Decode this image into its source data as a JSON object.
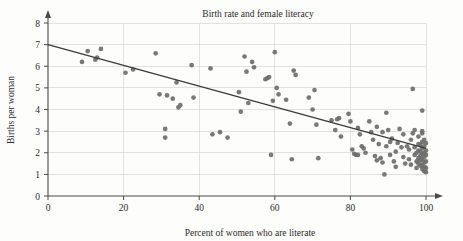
{
  "chart_data": {
    "type": "scatter",
    "title": "Birth rate and female literacy",
    "xlabel": "Percent of women who are literate",
    "ylabel": "Births per woman",
    "xlim": [
      0,
      100
    ],
    "ylim": [
      0,
      8
    ],
    "xticks": [
      0,
      20,
      40,
      60,
      80,
      100
    ],
    "yticks": [
      0,
      1,
      2,
      3,
      4,
      5,
      6,
      7,
      8
    ],
    "grid": true,
    "legend": "none",
    "marker_color": "#6e6e6e",
    "trendline": {
      "label": "least-squares regression line",
      "color": "#3a3a3a",
      "x_start": 0,
      "y_start": 7.0,
      "x_end": 100,
      "y_end": 2.2,
      "slope": -0.048,
      "intercept": 7.0
    },
    "points": [
      [
        9.0,
        6.2
      ],
      [
        10.5,
        6.7
      ],
      [
        12.5,
        6.3
      ],
      [
        13.0,
        6.4
      ],
      [
        14.0,
        6.8
      ],
      [
        20.5,
        5.7
      ],
      [
        22.5,
        5.85
      ],
      [
        28.5,
        6.6
      ],
      [
        29.5,
        4.7
      ],
      [
        31.0,
        3.1
      ],
      [
        31.0,
        2.7
      ],
      [
        31.5,
        4.65
      ],
      [
        33.0,
        4.5
      ],
      [
        34.0,
        5.25
      ],
      [
        34.5,
        4.1
      ],
      [
        35.0,
        4.2
      ],
      [
        38.0,
        6.05
      ],
      [
        38.5,
        4.55
      ],
      [
        43.0,
        5.9
      ],
      [
        43.5,
        2.85
      ],
      [
        45.5,
        2.95
      ],
      [
        47.5,
        2.7
      ],
      [
        50.5,
        4.8
      ],
      [
        51.0,
        3.9
      ],
      [
        52.0,
        6.45
      ],
      [
        52.5,
        5.75
      ],
      [
        53.0,
        4.3
      ],
      [
        54.0,
        6.2
      ],
      [
        54.5,
        5.95
      ],
      [
        57.5,
        5.4
      ],
      [
        58.0,
        5.45
      ],
      [
        58.5,
        5.5
      ],
      [
        59.0,
        1.9
      ],
      [
        59.5,
        4.4
      ],
      [
        60.0,
        6.65
      ],
      [
        60.5,
        5.0
      ],
      [
        61.0,
        4.7
      ],
      [
        63.0,
        4.45
      ],
      [
        64.0,
        3.35
      ],
      [
        64.5,
        1.7
      ],
      [
        65.0,
        5.8
      ],
      [
        65.5,
        5.6
      ],
      [
        69.0,
        4.55
      ],
      [
        70.0,
        4.0
      ],
      [
        70.5,
        4.9
      ],
      [
        71.0,
        3.3
      ],
      [
        71.5,
        1.75
      ],
      [
        75.0,
        3.5
      ],
      [
        76.0,
        3.05
      ],
      [
        76.5,
        3.55
      ],
      [
        77.0,
        3.6
      ],
      [
        77.5,
        2.75
      ],
      [
        79.5,
        3.8
      ],
      [
        80.0,
        3.45
      ],
      [
        80.5,
        2.15
      ],
      [
        81.0,
        1.95
      ],
      [
        81.5,
        1.9
      ],
      [
        82.0,
        3.15
      ],
      [
        82.5,
        2.85
      ],
      [
        83.0,
        2.3
      ],
      [
        83.5,
        2.2
      ],
      [
        85.0,
        3.45
      ],
      [
        85.5,
        2.95
      ],
      [
        86.0,
        2.6
      ],
      [
        86.5,
        1.85
      ],
      [
        87.0,
        3.2
      ],
      [
        87.5,
        2.4
      ],
      [
        88.0,
        1.75
      ],
      [
        88.5,
        1.55
      ],
      [
        89.0,
        1.0
      ],
      [
        89.5,
        3.85
      ],
      [
        90.0,
        3.05
      ],
      [
        90.5,
        2.5
      ],
      [
        91.0,
        2.65
      ],
      [
        91.5,
        1.6
      ],
      [
        92.0,
        2.05
      ],
      [
        92.5,
        2.45
      ],
      [
        93.0,
        3.1
      ],
      [
        93.5,
        2.25
      ],
      [
        94.0,
        1.8
      ],
      [
        94.5,
        1.5
      ],
      [
        95.0,
        2.3
      ],
      [
        95.5,
        2.15
      ],
      [
        95.5,
        1.7
      ],
      [
        96.0,
        2.6
      ],
      [
        96.0,
        1.45
      ],
      [
        96.5,
        4.95
      ],
      [
        96.5,
        2.9
      ],
      [
        97.0,
        3.05
      ],
      [
        97.0,
        2.25
      ],
      [
        97.0,
        1.9
      ],
      [
        97.5,
        2.0
      ],
      [
        97.5,
        1.6
      ],
      [
        97.5,
        1.3
      ],
      [
        98.0,
        2.75
      ],
      [
        98.0,
        2.4
      ],
      [
        98.0,
        2.1
      ],
      [
        98.0,
        1.75
      ],
      [
        98.0,
        1.5
      ],
      [
        98.5,
        2.35
      ],
      [
        98.5,
        2.05
      ],
      [
        98.5,
        1.85
      ],
      [
        98.5,
        1.65
      ],
      [
        98.5,
        1.4
      ],
      [
        99.0,
        3.95
      ],
      [
        99.0,
        3.0
      ],
      [
        99.0,
        2.9
      ],
      [
        99.0,
        2.5
      ],
      [
        99.0,
        2.2
      ],
      [
        99.0,
        1.95
      ],
      [
        99.0,
        1.7
      ],
      [
        99.0,
        1.45
      ],
      [
        99.0,
        1.25
      ],
      [
        99.5,
        2.6
      ],
      [
        99.5,
        2.3
      ],
      [
        99.5,
        2.0
      ],
      [
        99.5,
        1.8
      ],
      [
        99.5,
        1.55
      ],
      [
        99.5,
        1.35
      ],
      [
        99.5,
        1.15
      ],
      [
        100.0,
        2.45
      ],
      [
        100.0,
        2.1
      ],
      [
        100.0,
        1.9
      ],
      [
        100.0,
        1.6
      ],
      [
        100.0,
        1.3
      ],
      [
        100.0,
        1.1
      ],
      [
        94.0,
        2.85
      ],
      [
        92.0,
        1.35
      ],
      [
        90.5,
        1.9
      ],
      [
        89.5,
        2.3
      ],
      [
        88.5,
        2.95
      ],
      [
        87.0,
        1.65
      ],
      [
        84.0,
        2.0
      ],
      [
        82.0,
        1.9
      ]
    ]
  }
}
